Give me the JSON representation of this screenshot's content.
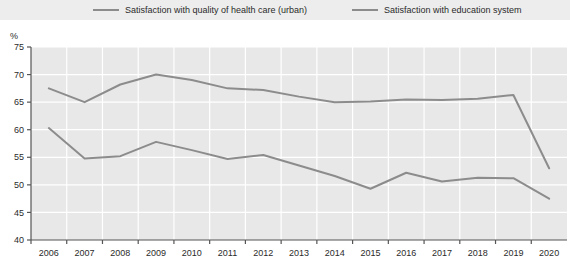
{
  "legend": {
    "position": "top",
    "entries": [
      {
        "label": "Satisfaction with quality of health care (urban)",
        "color": "#8c8c8c",
        "key": "health_care"
      },
      {
        "label": "Satisfaction with education system",
        "color": "#8c8c8c",
        "key": "education"
      }
    ]
  },
  "axes": {
    "unit_label": "%"
  },
  "chart_data": {
    "type": "line",
    "title": "",
    "subtitle": "",
    "xlabel": "",
    "ylabel": "%",
    "ylim": [
      40,
      75
    ],
    "yticks": [
      40,
      45,
      50,
      55,
      60,
      65,
      70,
      75
    ],
    "ytick_labels": [
      "40",
      "45",
      "50",
      "55",
      "60",
      "65",
      "70",
      "75"
    ],
    "grid": true,
    "legend_position": "top",
    "categories": [
      "2006",
      "2007",
      "2008",
      "2009",
      "2010",
      "2011",
      "2012",
      "2013",
      "2014",
      "2015",
      "2016",
      "2017",
      "2018",
      "2019",
      "2020"
    ],
    "x": [
      2006,
      2007,
      2008,
      2009,
      2010,
      2011,
      2012,
      2013,
      2014,
      2015,
      2016,
      2017,
      2018,
      2019,
      2020
    ],
    "series": [
      {
        "name": "Satisfaction with quality of health care (urban)",
        "color": "#8c8c8c",
        "values": [
          67.5,
          65.0,
          68.2,
          70.0,
          69.0,
          67.5,
          67.2,
          66.0,
          65.0,
          65.1,
          65.5,
          65.4,
          65.6,
          66.3,
          53.0
        ]
      },
      {
        "name": "Satisfaction with education system",
        "color": "#8c8c8c",
        "values": [
          60.3,
          54.8,
          55.2,
          57.8,
          56.3,
          54.7,
          55.4,
          53.5,
          51.6,
          49.3,
          52.2,
          50.6,
          51.3,
          51.2,
          47.5
        ]
      }
    ]
  },
  "colors": {
    "plot_background": "#e8e8e8",
    "gridline": "#ffffff",
    "axis": "#555555",
    "line": "#8c8c8c",
    "legend_background": "#ededed",
    "text": "#2b2b2b"
  }
}
